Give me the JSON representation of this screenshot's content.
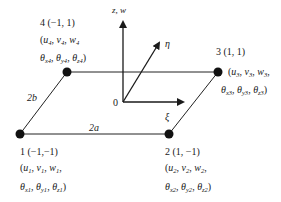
{
  "diagram": {
    "axes": {
      "vertical": "z, w",
      "eta": "η",
      "xi": "ξ",
      "origin": "0"
    },
    "dimensions": {
      "horizontal": "2a",
      "vertical": "2b"
    },
    "separator": ", ",
    "nodes": [
      {
        "label": "1 (−1,−1)",
        "open": "(",
        "translation": [
          {
            "sym": "u",
            "sub": "1"
          },
          {
            "sym": "v",
            "sub": "1"
          },
          {
            "sym": "w",
            "sub": "1"
          }
        ],
        "translation_end": ",",
        "rotation": [
          {
            "sym": "θ",
            "sub": "x1"
          },
          {
            "sym": "θ",
            "sub": "y1"
          },
          {
            "sym": "θ",
            "sub": "z1"
          }
        ],
        "close": ")"
      },
      {
        "label": "2 (1, −1)",
        "open": "(",
        "translation": [
          {
            "sym": "u",
            "sub": "2"
          },
          {
            "sym": "v",
            "sub": "2"
          },
          {
            "sym": "w",
            "sub": "2"
          }
        ],
        "translation_end": ",",
        "rotation": [
          {
            "sym": "θ",
            "sub": "x2"
          },
          {
            "sym": "θ",
            "sub": "y2"
          },
          {
            "sym": "θ",
            "sub": "z2"
          }
        ],
        "close": ")"
      },
      {
        "label": "3 (1, 1)",
        "open": "(",
        "translation": [
          {
            "sym": "u",
            "sub": "3"
          },
          {
            "sym": "v",
            "sub": "3"
          },
          {
            "sym": "w",
            "sub": "3"
          }
        ],
        "translation_end": ",",
        "rotation": [
          {
            "sym": "θ",
            "sub": "x3"
          },
          {
            "sym": "θ",
            "sub": "y3"
          },
          {
            "sym": "θ",
            "sub": "z3"
          }
        ],
        "close": ")"
      },
      {
        "label": "4 (−1, 1)",
        "open": "(",
        "translation": [
          {
            "sym": "u",
            "sub": "4"
          },
          {
            "sym": "v",
            "sub": "4"
          },
          {
            "sym": "w",
            "sub": "4"
          }
        ],
        "translation_end": "",
        "rotation": [
          {
            "sym": "θ",
            "sub": "x4"
          },
          {
            "sym": "θ",
            "sub": "y4"
          },
          {
            "sym": "θ",
            "sub": "z4"
          }
        ],
        "close": ")"
      }
    ],
    "colors": {
      "line": "#222222",
      "node": "#111111",
      "background": "#ffffff"
    }
  }
}
